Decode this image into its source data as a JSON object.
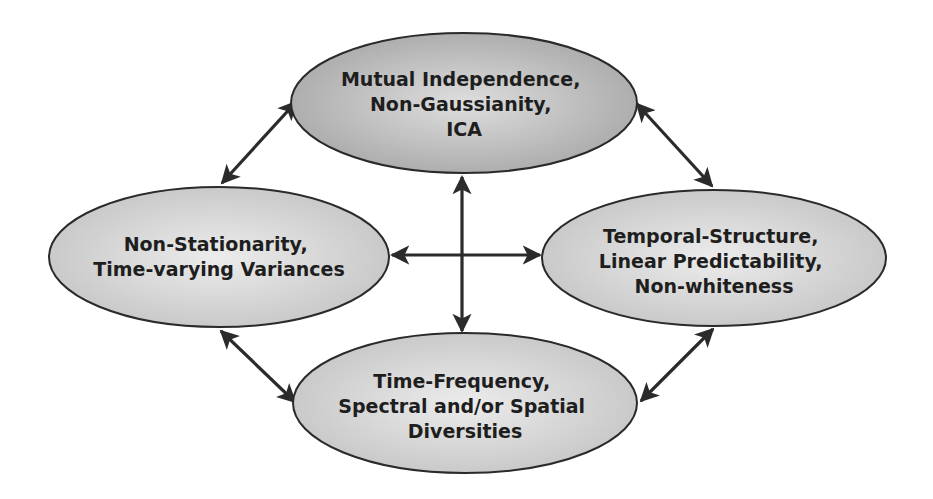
{
  "diagram": {
    "type": "concept-map",
    "colors": {
      "top_fill_edge": "#a8a8a8",
      "top_fill_center": "#dcdcdc",
      "side_fill_edge": "#c4c4c4",
      "side_fill_center": "#e8e8e8",
      "stroke": "#2a2a2a",
      "arrow": "#2b2b2b",
      "text": "#1e1e1e"
    },
    "nodes": {
      "top": {
        "lines": [
          "Mutual Independence,",
          "Non-Gaussianity,",
          "ICA"
        ]
      },
      "left": {
        "lines": [
          "Non-Stationarity,",
          "Time-varying Variances"
        ]
      },
      "right": {
        "lines": [
          "Temporal-Structure,",
          "Linear Predictability,",
          "Non-whiteness"
        ]
      },
      "bottom": {
        "lines": [
          "Time-Frequency,",
          "Spectral and/or Spatial",
          "Diversities"
        ]
      }
    },
    "edges": [
      {
        "from": "top",
        "to": "left",
        "direction": "bidirectional"
      },
      {
        "from": "top",
        "to": "right",
        "direction": "bidirectional"
      },
      {
        "from": "left",
        "to": "bottom",
        "direction": "bidirectional"
      },
      {
        "from": "right",
        "to": "bottom",
        "direction": "bidirectional"
      },
      {
        "from": "top",
        "to": "bottom",
        "direction": "bidirectional"
      },
      {
        "from": "left",
        "to": "right",
        "direction": "bidirectional"
      }
    ]
  }
}
